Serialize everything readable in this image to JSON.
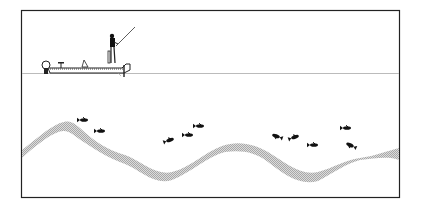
{
  "illustration": {
    "subject": "fishing boat over underwater structure with fish",
    "colors": {
      "frame": "#222222",
      "waterline": "#bbbbbb",
      "ink": "#111111",
      "bottom_band": "#cfcfcf"
    },
    "elements": {
      "angler": "angler-figure",
      "boat": "bass-boat",
      "rod": "fishing-rod",
      "bottom": "stippled-bottom-contour",
      "fish_count": 11
    },
    "fish": [
      {
        "x": 84,
        "y": 120,
        "angle": 0
      },
      {
        "x": 101,
        "y": 131,
        "angle": 0
      },
      {
        "x": 170,
        "y": 140,
        "angle": -20
      },
      {
        "x": 189,
        "y": 135,
        "angle": 0
      },
      {
        "x": 200,
        "y": 126,
        "angle": 0
      },
      {
        "x": 276,
        "y": 136,
        "angle": 20
      },
      {
        "x": 295,
        "y": 137,
        "angle": -20
      },
      {
        "x": 314,
        "y": 145,
        "angle": 0
      },
      {
        "x": 347,
        "y": 128,
        "angle": 0
      },
      {
        "x": 350,
        "y": 145,
        "angle": 25
      }
    ]
  }
}
